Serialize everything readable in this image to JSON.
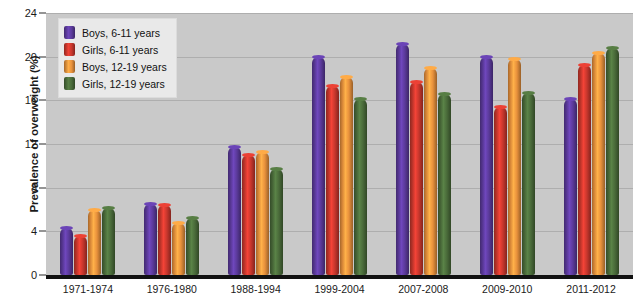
{
  "chart_data": {
    "type": "bar",
    "title": "",
    "subtitle": "",
    "xlabel": "",
    "ylabel": "Prevalence of overweight (%)",
    "ylim": [
      0,
      24
    ],
    "yticks": [
      0,
      4,
      8,
      12,
      16,
      20,
      24
    ],
    "grid": true,
    "legend_position": "top-left",
    "categories": [
      "1971-1974",
      "1976-1980",
      "1988-1994",
      "1999-2004",
      "2007-2008",
      "2009-2010",
      "2011-2012"
    ],
    "series": [
      {
        "name": "Boys, 6-11 years",
        "color": "#5b3a9b",
        "values": [
          4.3,
          6.5,
          11.7,
          20.0,
          21.2,
          20.0,
          16.1
        ]
      },
      {
        "name": "Girls, 6-11 years",
        "color": "#c8372d",
        "values": [
          3.6,
          6.4,
          11.0,
          17.3,
          17.7,
          15.4,
          19.2
        ]
      },
      {
        "name": "Boys, 12-19 years",
        "color": "#e8913c",
        "values": [
          6.0,
          4.8,
          11.3,
          18.1,
          19.0,
          19.8,
          20.3
        ]
      },
      {
        "name": "Girls, 12-19 years",
        "color": "#4a6b3a",
        "values": [
          6.1,
          5.2,
          9.7,
          16.1,
          16.6,
          16.7,
          20.8
        ]
      }
    ]
  },
  "colors": {
    "plot_background": "#c9c9c9",
    "page_background": "#ffffff",
    "gridline": "#aeaeae",
    "axis": "#111111",
    "legend_background": "#e9e9e9"
  }
}
